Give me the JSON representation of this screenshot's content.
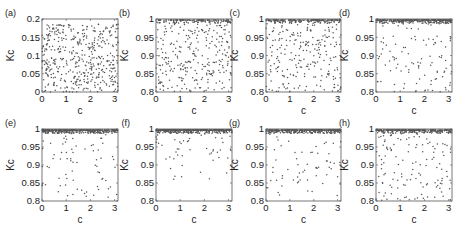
{
  "figure": {
    "panels": [
      {
        "id": "a",
        "label": "(a)",
        "box": [
          42,
          19,
          118,
          92
        ],
        "ylim": [
          0,
          0.2
        ],
        "yticks": [
          "0",
          "0.05",
          "0.1",
          "0.15",
          "0.2"
        ],
        "yvals": [
          0,
          0.05,
          0.1,
          0.15,
          0.2
        ]
      },
      {
        "id": "b",
        "label": "(b)",
        "box": [
          156,
          19,
          232,
          92
        ],
        "ylim": [
          0.8,
          1.0
        ],
        "yticks": [
          "0.8",
          "0.85",
          "0.9",
          "0.95",
          "1"
        ],
        "yvals": [
          0.8,
          0.85,
          0.9,
          0.95,
          1.0
        ]
      },
      {
        "id": "c",
        "label": "(c)",
        "box": [
          266,
          19,
          341,
          92
        ],
        "ylim": [
          0.8,
          1.0
        ],
        "yticks": [
          "0.8",
          "0.85",
          "0.9",
          "0.95",
          "1"
        ],
        "yvals": [
          0.8,
          0.85,
          0.9,
          0.95,
          1.0
        ]
      },
      {
        "id": "d",
        "label": "(d)",
        "box": [
          376,
          19,
          452,
          92
        ],
        "ylim": [
          0.8,
          1.0
        ],
        "yticks": [
          "0.8",
          "0.85",
          "0.9",
          "0.95",
          "1"
        ],
        "yvals": [
          0.8,
          0.85,
          0.9,
          0.95,
          1.0
        ]
      },
      {
        "id": "e",
        "label": "(e)",
        "box": [
          42,
          129,
          118,
          201
        ],
        "ylim": [
          0.8,
          1.0
        ],
        "yticks": [
          "0.8",
          "0.85",
          "0.9",
          "0.95",
          "1"
        ],
        "yvals": [
          0.8,
          0.85,
          0.9,
          0.95,
          1.0
        ]
      },
      {
        "id": "f",
        "label": "(f)",
        "box": [
          156,
          129,
          232,
          201
        ],
        "ylim": [
          0.8,
          1.0
        ],
        "yticks": [
          "0.8",
          "0.85",
          "0.9",
          "0.95",
          "1"
        ],
        "yvals": [
          0.8,
          0.85,
          0.9,
          0.95,
          1.0
        ]
      },
      {
        "id": "g",
        "label": "(g)",
        "box": [
          266,
          129,
          341,
          201
        ],
        "ylim": [
          0.8,
          1.0
        ],
        "yticks": [
          "0.8",
          "0.85",
          "0.9",
          "0.95",
          "1"
        ],
        "yvals": [
          0.8,
          0.85,
          0.9,
          0.95,
          1.0
        ]
      },
      {
        "id": "h",
        "label": "(h)",
        "box": [
          376,
          129,
          452,
          201
        ],
        "ylim": [
          0.8,
          1.0
        ],
        "yticks": [
          "0.8",
          "0.85",
          "0.9",
          "0.95",
          "1"
        ],
        "yvals": [
          0.8,
          0.85,
          0.9,
          0.95,
          1.0
        ]
      }
    ],
    "xticks": [
      "0",
      "1",
      "2",
      "3"
    ],
    "xvals": [
      0,
      1,
      2,
      3
    ],
    "xlim": [
      0,
      3.14
    ]
  },
  "chart_data": [
    {
      "type": "scatter",
      "title": "(a)",
      "xlabel": "c",
      "ylabel": "Kc",
      "xlim": [
        0,
        3.14
      ],
      "ylim": [
        0,
        0.2
      ],
      "xticks": [
        0,
        1,
        2,
        3
      ],
      "yticks": [
        0,
        0.05,
        0.1,
        0.15,
        0.2
      ],
      "distribution": "uniform",
      "n_points": 450,
      "concentration": 0.0,
      "spread_min": 0.0
    },
    {
      "type": "scatter",
      "title": "(b)",
      "xlabel": "c",
      "ylabel": "Kc",
      "xlim": [
        0,
        3.14
      ],
      "ylim": [
        0.8,
        1.0
      ],
      "xticks": [
        0,
        1,
        2,
        3
      ],
      "yticks": [
        0.8,
        0.85,
        0.9,
        0.95,
        1
      ],
      "distribution": "clustered-near-1",
      "n_points": 420,
      "concentration": 0.35,
      "spread_min": 0.8
    },
    {
      "type": "scatter",
      "title": "(c)",
      "xlabel": "c",
      "ylabel": "Kc",
      "xlim": [
        0,
        3.14
      ],
      "ylim": [
        0.8,
        1.0
      ],
      "xticks": [
        0,
        1,
        2,
        3
      ],
      "yticks": [
        0.8,
        0.85,
        0.9,
        0.95,
        1
      ],
      "distribution": "clustered-near-1",
      "n_points": 420,
      "concentration": 0.45,
      "spread_min": 0.8
    },
    {
      "type": "scatter",
      "title": "(d)",
      "xlabel": "c",
      "ylabel": "Kc",
      "xlim": [
        0,
        3.14
      ],
      "ylim": [
        0.8,
        1.0
      ],
      "xticks": [
        0,
        1,
        2,
        3
      ],
      "yticks": [
        0.8,
        0.85,
        0.9,
        0.95,
        1
      ],
      "distribution": "clustered-near-1",
      "n_points": 420,
      "concentration": 0.72,
      "spread_min": 0.8
    },
    {
      "type": "scatter",
      "title": "(e)",
      "xlabel": "c",
      "ylabel": "Kc",
      "xlim": [
        0,
        3.14
      ],
      "ylim": [
        0.8,
        1.0
      ],
      "xticks": [
        0,
        1,
        2,
        3
      ],
      "yticks": [
        0.8,
        0.85,
        0.9,
        0.95,
        1
      ],
      "distribution": "clustered-near-1",
      "n_points": 420,
      "concentration": 0.82,
      "spread_min": 0.81
    },
    {
      "type": "scatter",
      "title": "(f)",
      "xlabel": "c",
      "ylabel": "Kc",
      "xlim": [
        0,
        3.14
      ],
      "ylim": [
        0.8,
        1.0
      ],
      "xticks": [
        0,
        1,
        2,
        3
      ],
      "yticks": [
        0.8,
        0.85,
        0.9,
        0.95,
        1
      ],
      "distribution": "clustered-near-1",
      "n_points": 420,
      "concentration": 0.9,
      "spread_min": 0.86
    },
    {
      "type": "scatter",
      "title": "(g)",
      "xlabel": "c",
      "ylabel": "Kc",
      "xlim": [
        0,
        3.14
      ],
      "ylim": [
        0.8,
        1.0
      ],
      "xticks": [
        0,
        1,
        2,
        3
      ],
      "yticks": [
        0.8,
        0.85,
        0.9,
        0.95,
        1
      ],
      "distribution": "clustered-near-1",
      "n_points": 420,
      "concentration": 0.8,
      "spread_min": 0.81
    },
    {
      "type": "scatter",
      "title": "(h)",
      "xlabel": "c",
      "ylabel": "Kc",
      "xlim": [
        0,
        3.14
      ],
      "ylim": [
        0.8,
        1.0
      ],
      "xticks": [
        0,
        1,
        2,
        3
      ],
      "yticks": [
        0.8,
        0.85,
        0.9,
        0.95,
        1
      ],
      "distribution": "clustered-near-1",
      "n_points": 420,
      "concentration": 0.7,
      "spread_min": 0.8
    }
  ],
  "labels": {
    "xlabel": "c",
    "ylabel": "Kc"
  },
  "colors": {
    "marker": "#555555",
    "frame": "#555555",
    "text": "#222222"
  }
}
